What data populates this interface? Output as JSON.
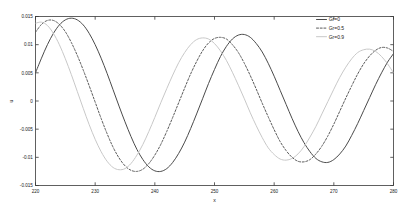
{
  "chart_data": {
    "type": "line",
    "title": "",
    "xlabel": "x",
    "ylabel": "u",
    "xlim": [
      220,
      280
    ],
    "ylim": [
      -0.015,
      0.015
    ],
    "xticks": [
      220,
      230,
      240,
      250,
      260,
      270,
      280
    ],
    "xtick_labels": [
      "220",
      "230",
      "240",
      "250",
      "260",
      "270",
      "280"
    ],
    "yticks": [
      -0.015,
      -0.01,
      -0.005,
      0,
      0.005,
      0.01,
      0.015
    ],
    "ytick_labels": [
      "-0.015",
      "-0.01",
      "-0.005",
      "0",
      "0.005",
      "0.01",
      "0.015"
    ],
    "grid": false,
    "legend_position": "top-right",
    "series": [
      {
        "name": "Gr=0",
        "label": "Gr=0",
        "color": "#4a4a4a",
        "linestyle": "solid",
        "amplitude": 0.01455,
        "decay": 0.0042,
        "period": 22.0,
        "phase_x0": 217.6,
        "x": [
          220,
          221,
          222,
          223,
          224,
          225,
          226,
          227,
          228,
          229,
          230,
          231,
          232,
          233,
          234,
          235,
          236,
          237,
          238,
          239,
          240,
          241,
          242,
          243,
          244,
          245,
          246,
          247,
          248,
          249,
          250,
          251,
          252,
          253,
          254,
          255,
          256,
          257,
          258,
          259,
          260,
          261,
          262,
          263,
          264,
          265,
          266,
          267,
          268,
          269,
          270,
          271,
          272,
          273,
          274,
          275,
          276,
          277,
          278,
          279,
          280
        ],
        "y": [
          0.005,
          0.0076,
          0.01,
          0.012,
          0.0135,
          0.0144,
          0.0147,
          0.0144,
          0.0135,
          0.012,
          0.01,
          0.0076,
          0.0049,
          0.002,
          -0.0009,
          -0.0037,
          -0.0063,
          -0.0086,
          -0.0104,
          -0.0117,
          -0.0124,
          -0.0125,
          -0.012,
          -0.0109,
          -0.0093,
          -0.0073,
          -0.0049,
          -0.0023,
          0.0004,
          0.0031,
          0.0056,
          0.0079,
          0.0097,
          0.011,
          0.0117,
          0.0118,
          0.0113,
          0.0102,
          0.0087,
          0.0067,
          0.0044,
          0.0019,
          -0.0006,
          -0.0031,
          -0.0054,
          -0.0074,
          -0.009,
          -0.0102,
          -0.0108,
          -0.0109,
          -0.0104,
          -0.0094,
          -0.008,
          -0.0061,
          -0.004,
          -0.0017,
          0.0006,
          0.0029,
          0.005,
          0.0069,
          0.0084
        ]
      },
      {
        "name": "Gr=0.5",
        "label": "Gr=0.5",
        "color": "#5a5a5a",
        "linestyle": "dashed",
        "amplitude": 0.01425,
        "decay": 0.004,
        "period": 22.0,
        "phase_x0": 215.0,
        "x": [
          220,
          221,
          222,
          223,
          224,
          225,
          226,
          227,
          228,
          229,
          230,
          231,
          232,
          233,
          234,
          235,
          236,
          237,
          238,
          239,
          240,
          241,
          242,
          243,
          244,
          245,
          246,
          247,
          248,
          249,
          250,
          251,
          252,
          253,
          254,
          255,
          256,
          257,
          258,
          259,
          260,
          261,
          262,
          263,
          264,
          265,
          266,
          267,
          268,
          269,
          270,
          271,
          272,
          273,
          274,
          275,
          276,
          277,
          278,
          279,
          280
        ],
        "y": [
          0.0122,
          0.0136,
          0.0143,
          0.0143,
          0.0136,
          0.0123,
          0.0104,
          0.0081,
          0.0055,
          0.0027,
          -0.0002,
          -0.0031,
          -0.0058,
          -0.0082,
          -0.0101,
          -0.0115,
          -0.0123,
          -0.0125,
          -0.0121,
          -0.0111,
          -0.0096,
          -0.0077,
          -0.0054,
          -0.0029,
          -0.0003,
          0.0023,
          0.0048,
          0.007,
          0.0089,
          0.0103,
          0.0111,
          0.0113,
          0.011,
          0.01,
          0.0086,
          0.0067,
          0.0045,
          0.0021,
          -0.0004,
          -0.0028,
          -0.0051,
          -0.0072,
          -0.0088,
          -0.01,
          -0.0107,
          -0.0108,
          -0.0104,
          -0.0094,
          -0.008,
          -0.0062,
          -0.0041,
          -0.0018,
          0.0005,
          0.0027,
          0.0048,
          0.0066,
          0.008,
          0.009,
          0.0095,
          0.0094,
          0.0088
        ]
      },
      {
        "name": "Gr=0.9",
        "label": "Gr=0.9",
        "color": "#c8c8c8",
        "linestyle": "solid",
        "amplitude": 0.014,
        "decay": 0.0038,
        "period": 22.0,
        "phase_x0": 212.6,
        "x": [
          220,
          221,
          222,
          223,
          224,
          225,
          226,
          227,
          228,
          229,
          230,
          231,
          232,
          233,
          234,
          235,
          236,
          237,
          238,
          239,
          240,
          241,
          242,
          243,
          244,
          245,
          246,
          247,
          248,
          249,
          250,
          251,
          252,
          253,
          254,
          255,
          256,
          257,
          258,
          259,
          260,
          261,
          262,
          263,
          264,
          265,
          266,
          267,
          268,
          269,
          270,
          271,
          272,
          273,
          274,
          275,
          276,
          277,
          278,
          279,
          280
        ],
        "y": [
          0.0138,
          0.014,
          0.0134,
          0.012,
          0.01,
          0.0075,
          0.0047,
          0.0017,
          -0.0013,
          -0.0042,
          -0.0068,
          -0.009,
          -0.0107,
          -0.0118,
          -0.0122,
          -0.012,
          -0.0111,
          -0.0096,
          -0.0077,
          -0.0054,
          -0.0029,
          -0.0003,
          0.0022,
          0.0046,
          0.0068,
          0.0086,
          0.01,
          0.0109,
          0.0112,
          0.011,
          0.0102,
          0.0089,
          0.0072,
          0.0051,
          0.0028,
          0.0004,
          -0.0021,
          -0.0044,
          -0.0065,
          -0.0083,
          -0.0095,
          -0.0103,
          -0.0105,
          -0.0102,
          -0.0094,
          -0.0081,
          -0.0064,
          -0.0045,
          -0.0023,
          -0.0001,
          0.0021,
          0.0042,
          0.006,
          0.0075,
          0.0086,
          0.0091,
          0.0092,
          0.0088,
          0.0079,
          0.0066,
          0.005
        ]
      }
    ]
  },
  "axes": {
    "xlabel": "x",
    "ylabel": "u"
  },
  "legend": {
    "entries": [
      {
        "label": "Gr=0"
      },
      {
        "label": "Gr=0.5"
      },
      {
        "label": "Gr=0.9"
      }
    ]
  }
}
